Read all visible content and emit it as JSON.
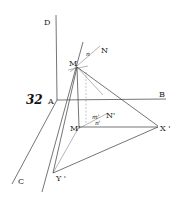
{
  "figure": {
    "number": "32",
    "labels": {
      "D": "D",
      "A": "A",
      "B": "B",
      "C": "C",
      "M": "M",
      "N": "N",
      "n": "n",
      "M_prime": "M'",
      "m_prime": "m'",
      "n_prime": "n'",
      "N_prime": "N'",
      "X_prime": "X '",
      "Y_prime": "Y '"
    }
  }
}
